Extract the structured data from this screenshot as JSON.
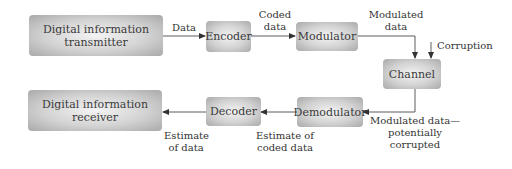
{
  "diagram": {
    "nodes": {
      "transmitter": {
        "label_line1": "Digital information",
        "label_line2": "transmitter"
      },
      "encoder": {
        "label": "Encoder"
      },
      "modulator": {
        "label": "Modulator"
      },
      "channel": {
        "label": "Channel"
      },
      "demodulator": {
        "label": "Demodulator"
      },
      "decoder": {
        "label": "Decoder"
      },
      "receiver": {
        "label_line1": "Digital information",
        "label_line2": "receiver"
      }
    },
    "edges": {
      "data": {
        "label": "Data"
      },
      "coded_data": {
        "label_line1": "Coded",
        "label_line2": "data"
      },
      "modulated_data": {
        "label_line1": "Modulated",
        "label_line2": "data"
      },
      "corruption": {
        "label": "Corruption"
      },
      "modulated_corrupted": {
        "label_line1": "Modulated data—",
        "label_line2": "potentially",
        "label_line3": "corrupted"
      },
      "estimate_coded": {
        "label_line1": "Estimate of",
        "label_line2": "coded data"
      },
      "estimate_data": {
        "label_line1": "Estimate",
        "label_line2": "of data"
      }
    },
    "colors": {
      "line": "#333333",
      "box_center": "#f4f4f4",
      "box_edge": "#a9a9a9",
      "text": "#333333"
    }
  }
}
